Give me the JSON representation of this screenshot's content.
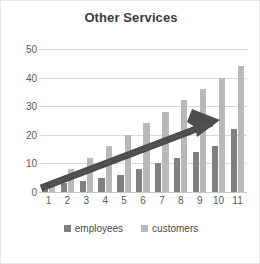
{
  "chart_data": {
    "type": "bar",
    "title": "Other Services",
    "xlabel": "",
    "ylabel": "",
    "categories": [
      "1",
      "2",
      "3",
      "4",
      "5",
      "6",
      "7",
      "8",
      "9",
      "10",
      "11"
    ],
    "series": [
      {
        "name": "employees",
        "color": "#808080",
        "values": [
          2,
          3,
          4,
          5,
          6,
          8,
          10,
          12,
          14,
          16,
          22
        ]
      },
      {
        "name": "customers",
        "color": "#b9b9b9",
        "values": [
          2,
          8,
          12,
          16,
          20,
          24,
          28,
          32,
          36,
          40,
          44
        ]
      }
    ],
    "ylim": [
      0,
      50
    ],
    "yticks": [
      0,
      10,
      20,
      30,
      40,
      50
    ],
    "ytick_labels": [
      "0",
      "10",
      "20",
      "30",
      "40",
      "50"
    ],
    "grid": true,
    "legend_position": "bottom",
    "annotations": [
      {
        "name": "trend-arrow",
        "type": "arrow",
        "description": "thick dark upward trend arrow from lower-left to upper-right"
      }
    ]
  },
  "legend": {
    "items": [
      {
        "label": "employees",
        "color": "#808080"
      },
      {
        "label": "customers",
        "color": "#b9b9b9"
      }
    ]
  },
  "colors": {
    "employees": "#808080",
    "customers": "#b9b9b9",
    "arrow": "#4a4a4a",
    "grid": "#d9d9d9",
    "text": "#5a5a5a",
    "title": "#3a3a3a",
    "background": "#ffffff"
  }
}
